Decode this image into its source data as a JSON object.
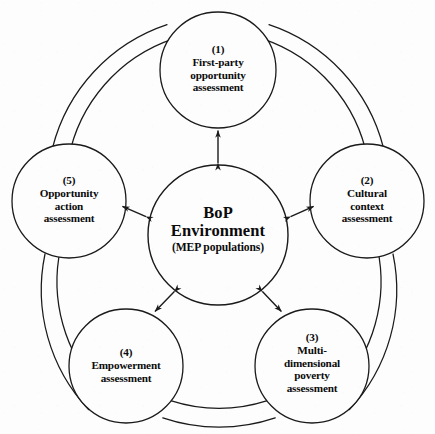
{
  "diagram": {
    "type": "cycle-diagram",
    "stroke_color": "#1a1a1a",
    "background_color": "#fdfdfd",
    "text_color": "#0b0b0b",
    "center": {
      "line1": "BoP",
      "line2": "Environment",
      "line3": "(MEP populations)",
      "cx": 218,
      "cy": 235,
      "r": 70
    },
    "nodes": [
      {
        "index": "(1)",
        "line1": "First-party",
        "line2": "opportunity",
        "line3": "assessment",
        "cx": 218,
        "cy": 70,
        "r": 58
      },
      {
        "index": "(2)",
        "line1": "Cultural",
        "line2": "context",
        "line3": "assessment",
        "cx": 367,
        "cy": 201,
        "r": 57
      },
      {
        "index": "(3)",
        "line1": "Multi-",
        "line2": "dimensional",
        "line3": "poverty",
        "line4": "assessment",
        "cx": 312,
        "cy": 366,
        "r": 57
      },
      {
        "index": "(4)",
        "line1": "Empowerment",
        "line2": "assessment",
        "cx": 126,
        "cy": 366,
        "r": 57
      },
      {
        "index": "(5)",
        "line1": "Opportunity",
        "line2": "action",
        "line3": "assessment",
        "cx": 69,
        "cy": 201,
        "r": 57
      }
    ],
    "connections": {
      "ring_label": "outer ring band",
      "spoke_label": "bidirectional spoke arrow",
      "spokes": [
        {
          "from": "center",
          "to": "(1)",
          "bidirectional": true
        },
        {
          "from": "center",
          "to": "(2)",
          "bidirectional": true
        },
        {
          "from": "center",
          "to": "(3)",
          "bidirectional": true
        },
        {
          "from": "center",
          "to": "(4)",
          "bidirectional": true
        },
        {
          "from": "center",
          "to": "(5)",
          "bidirectional": true
        }
      ],
      "ring_segments": [
        {
          "from": "(5)",
          "to": "(1)"
        },
        {
          "from": "(1)",
          "to": "(2)"
        },
        {
          "from": "(2)",
          "to": "(3)"
        },
        {
          "from": "(3)",
          "to": "(4)"
        },
        {
          "from": "(4)",
          "to": "(5)"
        }
      ]
    }
  }
}
